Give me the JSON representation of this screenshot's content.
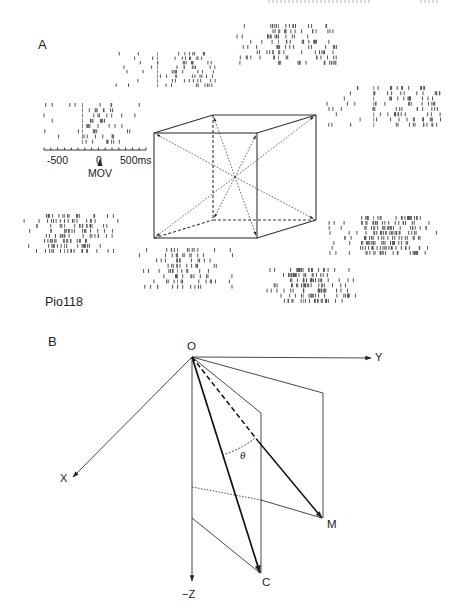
{
  "panel_a": {
    "letter": "A",
    "cell_id": "Pio118",
    "time_axis": {
      "ticks": [
        "-500",
        "0",
        "500ms"
      ],
      "event_label": "MOV",
      "range_ms": [
        -750,
        750
      ],
      "minor_tick_ms": 100
    },
    "cube": {
      "description": "Cube with 8 movement directions from center to corners (dotted double-headed arrows)",
      "vertices": {
        "front_top_left": [
          154,
          133
        ],
        "front_top_right": [
          257,
          133
        ],
        "front_bottom_left": [
          154,
          238
        ],
        "front_bottom_right": [
          257,
          238
        ],
        "back_top_left": [
          213,
          115
        ],
        "back_top_right": [
          316,
          115
        ],
        "back_bottom_left": [
          213,
          220
        ],
        "back_bottom_right": [
          316,
          220
        ]
      },
      "center": [
        235,
        177
      ]
    },
    "rasters": [
      {
        "name": "raster-back-top-left",
        "x": 115,
        "y": 52,
        "w": 100,
        "h": 36,
        "rows": 8,
        "density": 0.18,
        "burst": [
          0.55,
          1.0
        ]
      },
      {
        "name": "raster-back-top-right",
        "x": 236,
        "y": 24,
        "w": 100,
        "h": 42,
        "rows": 8,
        "density": 0.28,
        "burst": [
          0.3,
          1.0
        ]
      },
      {
        "name": "raster-left",
        "x": 40,
        "y": 103,
        "w": 100,
        "h": 42,
        "rows": 8,
        "density": 0.14,
        "burst": [
          0.45,
          0.75
        ]
      },
      {
        "name": "raster-right",
        "x": 325,
        "y": 86,
        "w": 115,
        "h": 42,
        "rows": 8,
        "density": 0.22,
        "burst": [
          0.4,
          1.0
        ]
      },
      {
        "name": "raster-bottom-left",
        "x": 22,
        "y": 214,
        "w": 100,
        "h": 40,
        "rows": 8,
        "density": 0.3,
        "burst": [
          0.2,
          0.7
        ]
      },
      {
        "name": "raster-bottom-right",
        "x": 327,
        "y": 216,
        "w": 110,
        "h": 40,
        "rows": 8,
        "density": 0.4,
        "burst": [
          0.3,
          0.85
        ]
      },
      {
        "name": "raster-bottom-center-left",
        "x": 133,
        "y": 248,
        "w": 105,
        "h": 42,
        "rows": 8,
        "density": 0.2,
        "burst": [
          0.3,
          0.8
        ]
      },
      {
        "name": "raster-bottom-center-right",
        "x": 265,
        "y": 268,
        "w": 90,
        "h": 36,
        "rows": 7,
        "density": 0.42,
        "burst": [
          0.25,
          0.7
        ]
      }
    ]
  },
  "panel_b": {
    "letter": "B",
    "origin_label": "O",
    "axis_labels": {
      "x": "X",
      "y": "Y",
      "z": "−Z"
    },
    "points": {
      "m": "M",
      "c": "C"
    },
    "angle_label": "θ",
    "geometry": {
      "O": [
        192,
        357
      ],
      "Y_end": [
        371,
        358
      ],
      "X_end": [
        73,
        477
      ],
      "Z_end": [
        192,
        581
      ],
      "M": [
        322,
        518
      ],
      "C": [
        260,
        573
      ],
      "plane_C_top": [
        261,
        413
      ],
      "plane_M_top": [
        323,
        393
      ],
      "plane_M_bottom": [
        323,
        518
      ],
      "proj_mid": [
        258,
        441
      ],
      "dotted_start": [
        192,
        487
      ],
      "dotted_end": [
        261,
        500
      ],
      "lower_start": [
        192,
        518
      ]
    }
  },
  "colors": {
    "ink": "#222222",
    "raster_ink": "#555555",
    "background": "#ffffff"
  }
}
